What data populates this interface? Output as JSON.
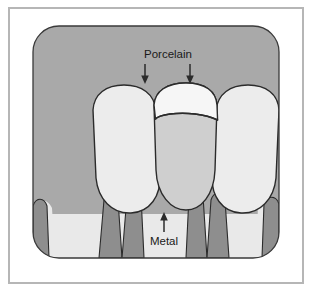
{
  "figure": {
    "frame": {
      "border_color": "#b6b6b6",
      "page_background": "#ffffff"
    },
    "panel": {
      "background_color": "#a9a9a9",
      "corner_radius": 26
    },
    "labels": [
      {
        "id": "porcelain",
        "text": "Porcelain",
        "x": 168,
        "y": 58,
        "pointer": "down",
        "arrow_count": 2
      },
      {
        "id": "metal",
        "text": "Metal",
        "x": 164,
        "y": 240,
        "pointer": "up",
        "arrow_count": 1
      }
    ],
    "legend_colors": {
      "gingiva_dark": "#8e8e8e",
      "tooth_light": "#ececec",
      "porcelain": "#f6f6f6",
      "metal": "#cfcfcf",
      "outline": "#2b2b2b"
    },
    "anatomy": [
      {
        "id": "left-tooth",
        "name": "natural tooth (left incisor)",
        "material": "enamel"
      },
      {
        "id": "center-crown",
        "name": "porcelain-fused-to-metal crown",
        "material": "porcelain over metal"
      },
      {
        "id": "right-tooth",
        "name": "natural tooth (right incisor)",
        "material": "enamel"
      },
      {
        "id": "gingiva",
        "name": "gingiva with interdental papillae",
        "material": "soft tissue"
      }
    ]
  }
}
